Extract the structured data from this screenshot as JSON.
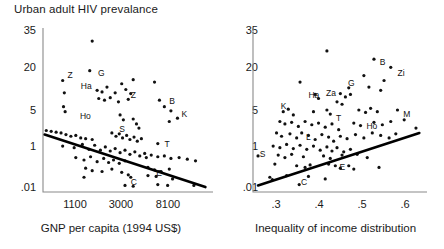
{
  "figure": {
    "title": "Urban adult HIV prevalance",
    "background": "#ffffff",
    "axis_color": "#8a8a8a",
    "point_color": "#111111",
    "line_color": "#000000"
  },
  "chart_data": [
    {
      "type": "scatter",
      "panel": "left",
      "title": "Urban adult HIV prevalance",
      "xlabel": "GNP per capita (1994 US$)",
      "ylabel": "Urban adult HIV prevalance",
      "xscale": "log",
      "yscale": "log",
      "xticks": [
        "1100",
        "3000",
        "8100"
      ],
      "yticks": [
        "35",
        "20",
        "5",
        "1",
        ".01"
      ],
      "grid": false,
      "legend": "none",
      "trendline": {
        "direction": "negative",
        "x0": 1.0,
        "y0": 35.0,
        "x1": 99.0,
        "y1": 3.0
      },
      "annotations": [
        {
          "label": "Z",
          "x": 13.5,
          "y": 71.0
        },
        {
          "label": "G",
          "x": 32.0,
          "y": 72.5
        },
        {
          "label": "Ha",
          "x": 21.5,
          "y": 64.5
        },
        {
          "label": "Z",
          "x": 52.0,
          "y": 59.0
        },
        {
          "label": "Ho",
          "x": 21.0,
          "y": 46.0
        },
        {
          "label": "S",
          "x": 45.0,
          "y": 38.0
        },
        {
          "label": "B",
          "x": 75.5,
          "y": 55.0
        },
        {
          "label": "K",
          "x": 83.0,
          "y": 47.5
        },
        {
          "label": "T",
          "x": 72.5,
          "y": 29.0
        },
        {
          "label": "C",
          "x": 52.0,
          "y": 6.0
        },
        {
          "label": "E",
          "x": 67.5,
          "y": 11.5
        }
      ],
      "points": [
        {
          "x": 30.0,
          "y": 92.0
        },
        {
          "x": 12.0,
          "y": 68.0
        },
        {
          "x": 28.5,
          "y": 74.0
        },
        {
          "x": 48.0,
          "y": 66.0
        },
        {
          "x": 55.0,
          "y": 68.5
        },
        {
          "x": 68.0,
          "y": 67.0
        },
        {
          "x": 13.0,
          "y": 60.5
        },
        {
          "x": 33.0,
          "y": 62.0
        },
        {
          "x": 36.0,
          "y": 61.0
        },
        {
          "x": 39.0,
          "y": 64.0
        },
        {
          "x": 44.0,
          "y": 60.5
        },
        {
          "x": 50.5,
          "y": 62.5
        },
        {
          "x": 53.5,
          "y": 60.0
        },
        {
          "x": 34.0,
          "y": 57.0
        },
        {
          "x": 37.5,
          "y": 56.0
        },
        {
          "x": 41.0,
          "y": 57.5
        },
        {
          "x": 46.0,
          "y": 55.0
        },
        {
          "x": 52.0,
          "y": 56.5
        },
        {
          "x": 12.5,
          "y": 52.0
        },
        {
          "x": 13.5,
          "y": 49.0
        },
        {
          "x": 71.0,
          "y": 56.0
        },
        {
          "x": 74.0,
          "y": 52.0
        },
        {
          "x": 78.0,
          "y": 49.5
        },
        {
          "x": 82.0,
          "y": 45.0
        },
        {
          "x": 77.0,
          "y": 43.0
        },
        {
          "x": 47.0,
          "y": 47.0
        },
        {
          "x": 49.0,
          "y": 44.0
        },
        {
          "x": 55.0,
          "y": 44.5
        },
        {
          "x": 57.0,
          "y": 41.5
        },
        {
          "x": 58.5,
          "y": 39.0
        },
        {
          "x": 2.0,
          "y": 37.5
        },
        {
          "x": 5.0,
          "y": 37.0
        },
        {
          "x": 8.0,
          "y": 36.5
        },
        {
          "x": 11.0,
          "y": 36.0
        },
        {
          "x": 14.0,
          "y": 35.0
        },
        {
          "x": 17.0,
          "y": 34.0
        },
        {
          "x": 20.0,
          "y": 34.5
        },
        {
          "x": 23.0,
          "y": 33.0
        },
        {
          "x": 26.0,
          "y": 32.5
        },
        {
          "x": 30.0,
          "y": 32.0
        },
        {
          "x": 42.0,
          "y": 36.0
        },
        {
          "x": 44.5,
          "y": 34.0
        },
        {
          "x": 46.5,
          "y": 35.5
        },
        {
          "x": 48.5,
          "y": 33.0
        },
        {
          "x": 51.0,
          "y": 34.5
        },
        {
          "x": 53.0,
          "y": 32.0
        },
        {
          "x": 55.5,
          "y": 33.5
        },
        {
          "x": 57.5,
          "y": 31.0
        },
        {
          "x": 60.0,
          "y": 32.5
        },
        {
          "x": 70.0,
          "y": 29.5
        },
        {
          "x": 12.0,
          "y": 28.0
        },
        {
          "x": 19.0,
          "y": 27.0
        },
        {
          "x": 24.0,
          "y": 29.0
        },
        {
          "x": 28.0,
          "y": 26.0
        },
        {
          "x": 31.5,
          "y": 28.5
        },
        {
          "x": 35.0,
          "y": 25.5
        },
        {
          "x": 38.0,
          "y": 27.5
        },
        {
          "x": 41.0,
          "y": 25.0
        },
        {
          "x": 44.0,
          "y": 26.5
        },
        {
          "x": 47.0,
          "y": 24.0
        },
        {
          "x": 50.0,
          "y": 25.5
        },
        {
          "x": 53.0,
          "y": 23.0
        },
        {
          "x": 56.0,
          "y": 24.5
        },
        {
          "x": 59.0,
          "y": 22.0
        },
        {
          "x": 62.0,
          "y": 23.5
        },
        {
          "x": 20.0,
          "y": 21.0
        },
        {
          "x": 25.0,
          "y": 19.5
        },
        {
          "x": 29.0,
          "y": 21.5
        },
        {
          "x": 33.0,
          "y": 18.5
        },
        {
          "x": 37.0,
          "y": 20.5
        },
        {
          "x": 40.0,
          "y": 18.0
        },
        {
          "x": 43.0,
          "y": 19.5
        },
        {
          "x": 46.5,
          "y": 17.5
        },
        {
          "x": 50.0,
          "y": 19.0
        },
        {
          "x": 63.0,
          "y": 21.0
        },
        {
          "x": 66.0,
          "y": 22.5
        },
        {
          "x": 70.0,
          "y": 21.5
        },
        {
          "x": 74.0,
          "y": 22.0
        },
        {
          "x": 78.0,
          "y": 20.5
        },
        {
          "x": 83.0,
          "y": 21.0
        },
        {
          "x": 88.0,
          "y": 20.0
        },
        {
          "x": 93.0,
          "y": 19.0
        },
        {
          "x": 26.0,
          "y": 14.5
        },
        {
          "x": 30.0,
          "y": 13.0
        },
        {
          "x": 36.0,
          "y": 12.5
        },
        {
          "x": 42.0,
          "y": 14.0
        },
        {
          "x": 48.0,
          "y": 12.0
        },
        {
          "x": 64.0,
          "y": 15.0
        },
        {
          "x": 68.0,
          "y": 13.5
        },
        {
          "x": 72.0,
          "y": 12.5
        },
        {
          "x": 77.0,
          "y": 14.0
        },
        {
          "x": 25.0,
          "y": 9.0
        },
        {
          "x": 52.0,
          "y": 10.5
        },
        {
          "x": 53.5,
          "y": 9.0
        },
        {
          "x": 64.0,
          "y": 10.0
        },
        {
          "x": 69.0,
          "y": 9.5
        },
        {
          "x": 79.0,
          "y": 8.0
        },
        {
          "x": 50.0,
          "y": 4.0
        },
        {
          "x": 55.0,
          "y": 3.5
        },
        {
          "x": 70.0,
          "y": 4.5
        },
        {
          "x": 76.0,
          "y": 4.0
        },
        {
          "x": 92.0,
          "y": 4.0
        }
      ]
    },
    {
      "type": "scatter",
      "panel": "right",
      "title": "",
      "xlabel": "Inequality of income distribution",
      "ylabel": "Urban adult HIV prevalance",
      "xscale": "linear",
      "yscale": "log",
      "xticks": [
        ".3",
        ".4",
        ".5",
        ".6"
      ],
      "yticks": [
        "35",
        "20",
        "5",
        "1",
        ".01"
      ],
      "grid": false,
      "legend": "none",
      "trendline": {
        "direction": "positive",
        "x0": 3.0,
        "y0": 4.0,
        "x1": 99.0,
        "y1": 36.0
      },
      "annotations": [
        {
          "label": "B",
          "x": 74.0,
          "y": 79.0
        },
        {
          "label": "Zi",
          "x": 84.5,
          "y": 72.0
        },
        {
          "label": "G",
          "x": 55.0,
          "y": 66.0
        },
        {
          "label": "Ha",
          "x": 31.5,
          "y": 59.0
        },
        {
          "label": "Za",
          "x": 42.0,
          "y": 60.0
        },
        {
          "label": "K",
          "x": 15.0,
          "y": 52.0
        },
        {
          "label": "T",
          "x": 48.0,
          "y": 45.0
        },
        {
          "label": "Ho",
          "x": 66.0,
          "y": 40.0
        },
        {
          "label": "M",
          "x": 88.0,
          "y": 47.0
        },
        {
          "label": "L",
          "x": 30.0,
          "y": 33.0
        },
        {
          "label": "S",
          "x": 2.5,
          "y": 23.0
        },
        {
          "label": "E",
          "x": 50.0,
          "y": 15.0
        },
        {
          "label": "C",
          "x": 27.0,
          "y": 6.0
        }
      ],
      "points": [
        {
          "x": 44.0,
          "y": 86.0
        },
        {
          "x": 72.0,
          "y": 81.0
        },
        {
          "x": 82.0,
          "y": 76.0
        },
        {
          "x": 66.0,
          "y": 71.0
        },
        {
          "x": 78.0,
          "y": 68.0
        },
        {
          "x": 28.0,
          "y": 67.0
        },
        {
          "x": 57.0,
          "y": 63.5
        },
        {
          "x": 69.0,
          "y": 64.0
        },
        {
          "x": 76.0,
          "y": 62.0
        },
        {
          "x": 37.0,
          "y": 59.5
        },
        {
          "x": 39.0,
          "y": 57.0
        },
        {
          "x": 52.0,
          "y": 60.0
        },
        {
          "x": 55.0,
          "y": 58.0
        },
        {
          "x": 58.0,
          "y": 59.5
        },
        {
          "x": 50.0,
          "y": 55.0
        },
        {
          "x": 53.0,
          "y": 53.5
        },
        {
          "x": 18.0,
          "y": 49.0
        },
        {
          "x": 21.0,
          "y": 50.5
        },
        {
          "x": 24.0,
          "y": 47.0
        },
        {
          "x": 36.0,
          "y": 49.0
        },
        {
          "x": 44.0,
          "y": 50.0
        },
        {
          "x": 46.0,
          "y": 47.5
        },
        {
          "x": 63.0,
          "y": 50.0
        },
        {
          "x": 67.0,
          "y": 48.5
        },
        {
          "x": 70.0,
          "y": 51.0
        },
        {
          "x": 74.0,
          "y": 49.0
        },
        {
          "x": 86.0,
          "y": 50.0
        },
        {
          "x": 16.0,
          "y": 43.0
        },
        {
          "x": 19.0,
          "y": 41.5
        },
        {
          "x": 23.0,
          "y": 42.5
        },
        {
          "x": 27.0,
          "y": 40.0
        },
        {
          "x": 31.0,
          "y": 43.0
        },
        {
          "x": 35.0,
          "y": 41.0
        },
        {
          "x": 39.0,
          "y": 42.0
        },
        {
          "x": 43.0,
          "y": 39.5
        },
        {
          "x": 47.0,
          "y": 41.5
        },
        {
          "x": 51.0,
          "y": 38.0
        },
        {
          "x": 60.0,
          "y": 42.0
        },
        {
          "x": 64.0,
          "y": 40.5
        },
        {
          "x": 72.0,
          "y": 42.5
        },
        {
          "x": 77.0,
          "y": 41.0
        },
        {
          "x": 82.0,
          "y": 43.0
        },
        {
          "x": 90.0,
          "y": 44.0
        },
        {
          "x": 97.0,
          "y": 39.0
        },
        {
          "x": 14.0,
          "y": 36.0
        },
        {
          "x": 17.0,
          "y": 34.0
        },
        {
          "x": 22.0,
          "y": 35.5
        },
        {
          "x": 26.0,
          "y": 33.0
        },
        {
          "x": 29.0,
          "y": 36.0
        },
        {
          "x": 33.0,
          "y": 34.5
        },
        {
          "x": 37.0,
          "y": 32.0
        },
        {
          "x": 41.0,
          "y": 35.0
        },
        {
          "x": 45.0,
          "y": 33.5
        },
        {
          "x": 48.0,
          "y": 31.0
        },
        {
          "x": 52.0,
          "y": 34.0
        },
        {
          "x": 56.0,
          "y": 32.5
        },
        {
          "x": 61.0,
          "y": 35.0
        },
        {
          "x": 66.0,
          "y": 33.0
        },
        {
          "x": 71.0,
          "y": 36.0
        },
        {
          "x": 76.0,
          "y": 34.5
        },
        {
          "x": 81.0,
          "y": 33.0
        },
        {
          "x": 85.0,
          "y": 35.5
        },
        {
          "x": 12.0,
          "y": 28.0
        },
        {
          "x": 16.0,
          "y": 27.0
        },
        {
          "x": 20.0,
          "y": 29.0
        },
        {
          "x": 24.0,
          "y": 26.5
        },
        {
          "x": 28.0,
          "y": 28.5
        },
        {
          "x": 32.0,
          "y": 26.0
        },
        {
          "x": 36.0,
          "y": 28.0
        },
        {
          "x": 40.0,
          "y": 25.5
        },
        {
          "x": 44.0,
          "y": 27.5
        },
        {
          "x": 47.0,
          "y": 25.0
        },
        {
          "x": 50.0,
          "y": 27.0
        },
        {
          "x": 54.0,
          "y": 24.5
        },
        {
          "x": 58.0,
          "y": 26.0
        },
        {
          "x": 3.0,
          "y": 22.0
        },
        {
          "x": 15.0,
          "y": 22.5
        },
        {
          "x": 19.0,
          "y": 21.0
        },
        {
          "x": 23.0,
          "y": 23.0
        },
        {
          "x": 30.0,
          "y": 21.5
        },
        {
          "x": 42.0,
          "y": 22.0
        },
        {
          "x": 46.0,
          "y": 20.5
        },
        {
          "x": 53.0,
          "y": 22.5
        },
        {
          "x": 62.0,
          "y": 23.0
        },
        {
          "x": 68.0,
          "y": 21.0
        },
        {
          "x": 13.0,
          "y": 17.0
        },
        {
          "x": 26.0,
          "y": 16.0
        },
        {
          "x": 31.0,
          "y": 15.0
        },
        {
          "x": 34.0,
          "y": 16.5
        },
        {
          "x": 45.0,
          "y": 17.0
        },
        {
          "x": 49.0,
          "y": 16.0
        },
        {
          "x": 52.0,
          "y": 14.5
        },
        {
          "x": 57.0,
          "y": 16.0
        },
        {
          "x": 60.0,
          "y": 14.0
        },
        {
          "x": 75.0,
          "y": 15.0
        },
        {
          "x": 10.0,
          "y": 9.0
        },
        {
          "x": 11.5,
          "y": 7.5
        },
        {
          "x": 20.0,
          "y": 10.0
        },
        {
          "x": 33.0,
          "y": 9.5
        },
        {
          "x": 43.0,
          "y": 8.0
        },
        {
          "x": 27.5,
          "y": 4.5
        }
      ]
    }
  ]
}
